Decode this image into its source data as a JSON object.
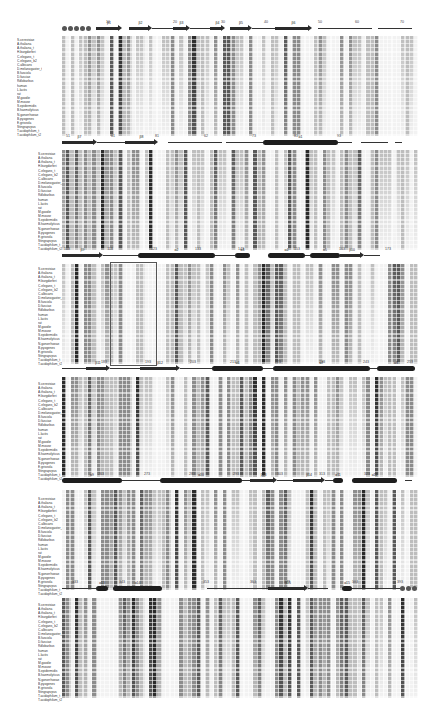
{
  "figure": {
    "type": "multiple_sequence_alignment",
    "sequences": [
      "S.cerevisiae",
      "A.thaliana",
      "A.thaliana_t",
      "H.burgdorferi",
      "C.elegans_t",
      "C.elegans_b2",
      "C.albicans",
      "D.melanogaster_t",
      "B.fasciola",
      "D.fasciae",
      "Rdlobarbus",
      "human",
      "L.lactis",
      "rat",
      "M.goodie",
      "M.mouse",
      "S.epidermidis",
      "B.haemolyticus",
      "N.gonorrhoeae",
      "B.pyogenes",
      "E.griseola",
      "Stingrapvpus",
      "T.acidophilum_t",
      "T.acidophilum_t2"
    ],
    "blocks": [
      {
        "id": 1,
        "position_markers": [
          {
            "label": "10",
            "x": 108
          },
          {
            "label": "20",
            "x": 175
          },
          {
            "label": "30",
            "x": 223
          },
          {
            "label": "40",
            "x": 266
          },
          {
            "label": "50",
            "x": 320
          },
          {
            "label": "60",
            "x": 357
          },
          {
            "label": "70",
            "x": 402
          }
        ],
        "ss_elements": [
          {
            "type": "dots",
            "x0": 62,
            "x1": 93
          },
          {
            "type": "strand",
            "x0": 96,
            "x1": 122,
            "label": "β1"
          },
          {
            "type": "strand",
            "x0": 129,
            "x1": 152,
            "label": "β2"
          },
          {
            "type": "line",
            "x0": 152,
            "x1": 173
          },
          {
            "type": "strand",
            "x0": 173,
            "x1": 190,
            "label": "β3"
          },
          {
            "type": "line",
            "x0": 190,
            "x1": 210
          },
          {
            "type": "strand",
            "x0": 210,
            "x1": 225,
            "label": "β4"
          },
          {
            "type": "strand",
            "x0": 230,
            "x1": 252,
            "label": "β5"
          },
          {
            "type": "line",
            "x0": 252,
            "x1": 275
          },
          {
            "type": "strand",
            "x0": 275,
            "x1": 312,
            "label": "β6"
          },
          {
            "type": "line",
            "x0": 318,
            "x1": 372
          },
          {
            "type": "line",
            "x0": 378,
            "x1": 412
          }
        ]
      },
      {
        "id": 2,
        "position_markers": [
          {
            "label": "51",
            "x": 68
          },
          {
            "label": "61",
            "x": 113
          },
          {
            "label": "81",
            "x": 157
          },
          {
            "label": "62",
            "x": 206
          },
          {
            "label": "73",
            "x": 254
          },
          {
            "label": "81",
            "x": 296
          },
          {
            "label": "93",
            "x": 339
          }
        ],
        "ss_elements": [
          {
            "type": "strand",
            "x0": 62,
            "x1": 97,
            "label": "β7"
          },
          {
            "type": "line",
            "x0": 97,
            "x1": 125
          },
          {
            "type": "strand",
            "x0": 125,
            "x1": 158,
            "label": "β8"
          },
          {
            "type": "line",
            "x0": 168,
            "x1": 222
          },
          {
            "type": "line",
            "x0": 226,
            "x1": 263
          },
          {
            "type": "helix",
            "x0": 263,
            "x1": 338,
            "label": "α1"
          },
          {
            "type": "line",
            "x0": 338,
            "x1": 352
          },
          {
            "type": "line",
            "x0": 361,
            "x1": 388
          },
          {
            "type": "line",
            "x0": 395,
            "x1": 402
          }
        ]
      },
      {
        "id": 3,
        "position_markers": [
          {
            "label": "103",
            "x": 67
          },
          {
            "label": "113",
            "x": 110
          },
          {
            "label": "123",
            "x": 154
          },
          {
            "label": "133",
            "x": 198
          },
          {
            "label": "143",
            "x": 241
          },
          {
            "label": "153",
            "x": 297
          },
          {
            "label": "163",
            "x": 342
          },
          {
            "label": "173",
            "x": 388
          }
        ],
        "ss_elements": [
          {
            "type": "strand",
            "x0": 62,
            "x1": 103,
            "label": "β9"
          },
          {
            "type": "line",
            "x0": 103,
            "x1": 138
          },
          {
            "type": "helix",
            "x0": 138,
            "x1": 215,
            "label": "α2"
          },
          {
            "type": "line",
            "x0": 215,
            "x1": 235
          },
          {
            "type": "helix",
            "x0": 235,
            "x1": 250,
            "label": "α3"
          },
          {
            "type": "helix",
            "x0": 268,
            "x1": 305,
            "label": "α4"
          },
          {
            "type": "line",
            "x0": 305,
            "x1": 310
          },
          {
            "type": "helix",
            "x0": 310,
            "x1": 340,
            "label": "α5"
          },
          {
            "type": "strand",
            "x0": 340,
            "x1": 364,
            "label": "β10"
          },
          {
            "type": "line",
            "x0": 364,
            "x1": 380
          }
        ],
        "boxed_region": {
          "x0": 110,
          "x1": 155
        }
      },
      {
        "id": 4,
        "position_markers": [
          {
            "label": "183",
            "x": 104
          },
          {
            "label": "193",
            "x": 148
          },
          {
            "label": "203",
            "x": 193
          },
          {
            "label": "213",
            "x": 233
          },
          {
            "label": "223",
            "x": 278
          },
          {
            "label": "233",
            "x": 322
          },
          {
            "label": "243",
            "x": 366
          },
          {
            "label": "253",
            "x": 410
          }
        ],
        "ss_elements": [
          {
            "type": "line",
            "x0": 62,
            "x1": 86
          },
          {
            "type": "strand",
            "x0": 86,
            "x1": 110,
            "label": "β11"
          },
          {
            "type": "line",
            "x0": 110,
            "x1": 140
          },
          {
            "type": "strand",
            "x0": 140,
            "x1": 180,
            "label": "β12"
          },
          {
            "type": "line",
            "x0": 180,
            "x1": 212
          },
          {
            "type": "helix",
            "x0": 212,
            "x1": 263,
            "label": "α6"
          },
          {
            "type": "line",
            "x0": 263,
            "x1": 273
          },
          {
            "type": "helix",
            "x0": 273,
            "x1": 370,
            "label": "α7"
          },
          {
            "type": "line",
            "x0": 370,
            "x1": 377
          },
          {
            "type": "helix",
            "x0": 377,
            "x1": 415,
            "label": "α8"
          }
        ]
      },
      {
        "id": 5,
        "position_markers": [
          {
            "label": "263",
            "x": 101
          },
          {
            "label": "273",
            "x": 147
          },
          {
            "label": "283",
            "x": 192
          },
          {
            "label": "293",
            "x": 236
          },
          {
            "label": "303",
            "x": 280
          },
          {
            "label": "313",
            "x": 322
          },
          {
            "label": "323",
            "x": 367
          }
        ],
        "ss_elements": [
          {
            "type": "helix",
            "x0": 62,
            "x1": 122,
            "label": "α9"
          },
          {
            "type": "line",
            "x0": 122,
            "x1": 160
          },
          {
            "type": "helix",
            "x0": 160,
            "x1": 242,
            "label": "α10"
          },
          {
            "type": "line",
            "x0": 242,
            "x1": 250
          },
          {
            "type": "strand",
            "x0": 250,
            "x1": 277,
            "label": "β13"
          },
          {
            "type": "line",
            "x0": 277,
            "x1": 293
          },
          {
            "type": "strand",
            "x0": 293,
            "x1": 325,
            "label": "β14"
          },
          {
            "type": "line",
            "x0": 325,
            "x1": 333
          },
          {
            "type": "helix",
            "x0": 333,
            "x1": 343,
            "label": "α11"
          },
          {
            "type": "helix",
            "x0": 352,
            "x1": 397,
            "label": "α12"
          },
          {
            "type": "line",
            "x0": 405,
            "x1": 412
          }
        ]
      },
      {
        "id": 6,
        "position_markers": [
          {
            "label": "333",
            "x": 75
          },
          {
            "label": "343",
            "x": 122
          },
          {
            "label": "353",
            "x": 206
          },
          {
            "label": "363",
            "x": 253
          },
          {
            "label": "373",
            "x": 287
          },
          {
            "label": "383",
            "x": 355
          },
          {
            "label": "393",
            "x": 400
          }
        ],
        "ss_elements": [
          {
            "type": "line",
            "x0": 62,
            "x1": 96
          },
          {
            "type": "helix",
            "x0": 96,
            "x1": 108,
            "label": "α13"
          },
          {
            "type": "helix",
            "x0": 113,
            "x1": 162,
            "label": "α14"
          },
          {
            "type": "line",
            "x0": 207,
            "x1": 268
          },
          {
            "type": "strand",
            "x0": 268,
            "x1": 308,
            "label": "β15"
          },
          {
            "type": "line",
            "x0": 308,
            "x1": 328
          },
          {
            "type": "helix",
            "x0": 342,
            "x1": 352,
            "label": "α15"
          },
          {
            "type": "line",
            "x0": 352,
            "x1": 400
          },
          {
            "type": "dots",
            "x0": 400,
            "x1": 420
          }
        ]
      }
    ],
    "block_layout": [
      {
        "label_top": 38,
        "grid_top": 36,
        "ss_top": 20,
        "grid_left": 62,
        "grid_right": 420,
        "labels_left": 17
      },
      {
        "label_top": 152,
        "grid_top": 150,
        "ss_top": 134,
        "grid_left": 62,
        "grid_right": 420,
        "labels_left": 38
      },
      {
        "label_top": 267,
        "grid_top": 264,
        "ss_top": 247,
        "grid_left": 62,
        "grid_right": 420,
        "labels_left": 38
      },
      {
        "label_top": 382,
        "grid_top": 377,
        "ss_top": 360,
        "grid_left": 62,
        "grid_right": 420,
        "labels_left": 38
      },
      {
        "label_top": 497,
        "grid_top": 490,
        "ss_top": 472,
        "grid_left": 62,
        "grid_right": 420,
        "labels_left": 38
      },
      {
        "label_top": 603,
        "grid_top": 598,
        "ss_top": 580,
        "grid_left": 62,
        "grid_right": 420,
        "labels_left": 38
      }
    ],
    "shading_legend": {
      "identical": "#2b2b2b",
      "highly_conserved": "#5a5a5a",
      "conserved": "#8c8c8c",
      "weakly_conserved": "#bdbdbd",
      "not_conserved": "#f2f2f2"
    }
  }
}
